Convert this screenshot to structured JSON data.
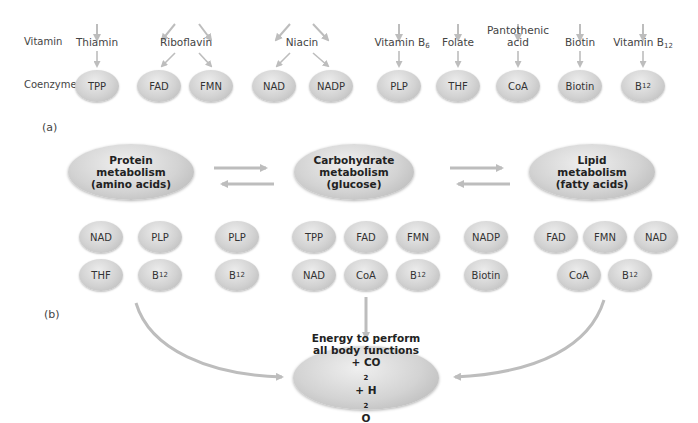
{
  "part_a": {
    "label": "(a)",
    "row_labels": {
      "vitamin": "Vitamin",
      "coenzyme": "Coenzyme"
    },
    "vitamins": [
      {
        "name": "Thiamin",
        "x": 293,
        "y": 15
      },
      {
        "name": "Riboflavin",
        "x": 188,
        "y": 15
      },
      {
        "name": "Niacin",
        "x": 302,
        "y": 15
      },
      {
        "name": "Vitamin B",
        "sub": "6",
        "x": 402,
        "y": 15
      },
      {
        "name": "Folate",
        "x": 458,
        "y": 15
      },
      {
        "name": "Pantothenic",
        "name2": "acid",
        "x": 518,
        "y": 3
      },
      {
        "name": "Biotin",
        "x": 580,
        "y": 15
      },
      {
        "name": "Vitamin B",
        "sub": "12",
        "x": 643,
        "y": 15
      }
    ],
    "coenzymes": [
      {
        "text": "TPP",
        "x": 97
      },
      {
        "text": "FAD",
        "x": 159
      },
      {
        "text": "FMN",
        "x": 211
      },
      {
        "text": "NAD",
        "x": 274
      },
      {
        "text": "NADP",
        "x": 331
      },
      {
        "text": "PLP",
        "x": 399
      },
      {
        "text": "THF",
        "x": 458
      },
      {
        "text": "CoA",
        "x": 518
      },
      {
        "text": "Biotin",
        "x": 580
      },
      {
        "text": "B",
        "sub": "12",
        "x": 643
      }
    ]
  },
  "part_b": {
    "label": "(b)",
    "processes": [
      {
        "line1": "Protein",
        "line2": "metabolism",
        "line3": "(amino acids)",
        "x": 131,
        "y": 172
      },
      {
        "line1": "Carbohydrate",
        "line2": "metabolism",
        "line3": "(glucose)",
        "x": 354,
        "y": 172
      },
      {
        "line1": "Lipid",
        "line2": "metabolism",
        "line3": "(fatty acids)",
        "x": 582,
        "y": 172
      }
    ],
    "coenzyme_rows": [
      {
        "text": "NAD",
        "x": 101,
        "y": 237
      },
      {
        "text": "PLP",
        "x": 160,
        "y": 237
      },
      {
        "text": "PLP",
        "x": 237,
        "y": 237
      },
      {
        "text": "TPP",
        "x": 314,
        "y": 237
      },
      {
        "text": "FAD",
        "x": 366,
        "y": 237
      },
      {
        "text": "FMN",
        "x": 418,
        "y": 237
      },
      {
        "text": "NADP",
        "x": 486,
        "y": 237
      },
      {
        "text": "FAD",
        "x": 556,
        "y": 237
      },
      {
        "text": "FMN",
        "x": 605,
        "y": 237
      },
      {
        "text": "NAD",
        "x": 656,
        "y": 237
      },
      {
        "text": "THF",
        "x": 101,
        "y": 275
      },
      {
        "text": "B",
        "sub": "12",
        "x": 160,
        "y": 275
      },
      {
        "text": "B",
        "sub": "12",
        "x": 237,
        "y": 275
      },
      {
        "text": "NAD",
        "x": 314,
        "y": 275
      },
      {
        "text": "CoA",
        "x": 366,
        "y": 275
      },
      {
        "text": "B",
        "sub": "12",
        "x": 418,
        "y": 275
      },
      {
        "text": "Biotin",
        "x": 486,
        "y": 275
      },
      {
        "text": "CoA",
        "x": 579,
        "y": 275
      },
      {
        "text": "B",
        "sub": "12",
        "x": 630,
        "y": 275
      }
    ],
    "energy": {
      "line1": "Energy to perform",
      "line2": "all body functions",
      "line3_prefix": "+ CO",
      "line3_sub1": "2",
      "line3_mid": " + H",
      "line3_sub2": "2",
      "line3_suffix": "O"
    }
  },
  "colors": {
    "arrow": "#bdbdbd",
    "pill_light": "#ececec",
    "pill_dark": "#b6b6b6",
    "text": "#333333"
  }
}
